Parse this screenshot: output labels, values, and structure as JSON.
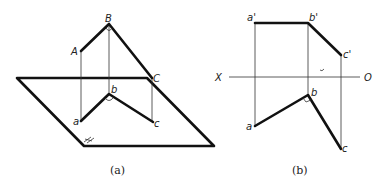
{
  "figure_a": {
    "caption": "(a)",
    "points_space": {
      "A": "A",
      "B": "B",
      "C": "C"
    },
    "points_projection": {
      "a": "a",
      "b": "b",
      "c": "c"
    },
    "plane_label": "H"
  },
  "figure_b": {
    "caption": "(b)",
    "axis": {
      "left": "X",
      "right": "O"
    },
    "points_front": {
      "a": "a'",
      "b": "b'",
      "c": "c'"
    },
    "points_top": {
      "a": "a",
      "b": "b",
      "c": "c"
    }
  }
}
